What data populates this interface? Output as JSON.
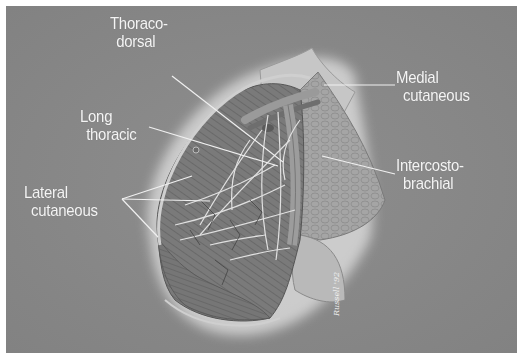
{
  "figure": {
    "type": "anatomical-illustration",
    "background_color": "#8a8a8a",
    "label_color": "#f4f4f4",
    "signature": "Russell '92"
  },
  "labels": [
    {
      "id": "thoracodorsal",
      "line1": "Thoraco-",
      "line2": "dorsal"
    },
    {
      "id": "long-thoracic",
      "line1": "Long",
      "line2": "thoracic"
    },
    {
      "id": "lateral-cutaneous",
      "line1": "Lateral",
      "line2": "cutaneous"
    },
    {
      "id": "medial-cutaneous",
      "line1": "Medial",
      "line2": "cutaneous"
    },
    {
      "id": "intercostobrachial",
      "line1": "Intercosto-",
      "line2": "brachial"
    }
  ]
}
